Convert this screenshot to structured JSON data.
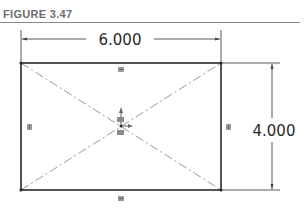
{
  "figure": {
    "label": "FIGURE 3.47"
  },
  "sketch": {
    "shape": "rectangle",
    "width_dimension": "6.000",
    "height_dimension": "4.000",
    "construction_lines": "diagonals",
    "relations": [
      "horizontal-top",
      "horizontal-bottom",
      "vertical-left",
      "vertical-right",
      "midpoint-center"
    ]
  },
  "colors": {
    "line": "#2a2a2a",
    "construction": "#8c8c8c",
    "title": "#6e6e6e"
  }
}
